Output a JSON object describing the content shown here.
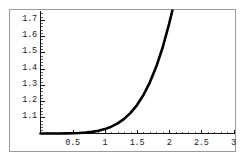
{
  "figure": {
    "name": "exponential-growth-plot",
    "frame_color": "#9a9a9a",
    "axis_color": "#141414",
    "curve_color": "#000000",
    "background": "#ffffff"
  },
  "chart_data": {
    "type": "line",
    "title": "",
    "subtitle": "",
    "xlabel": "",
    "ylabel": "",
    "xlim": [
      0,
      3
    ],
    "ylim": [
      1.0,
      1.75
    ],
    "grid": false,
    "legend": null,
    "annotations": [],
    "x_ticks": [
      {
        "value": 0.5,
        "label": "0.5"
      },
      {
        "value": 1,
        "label": "1"
      },
      {
        "value": 1.5,
        "label": "1.5"
      },
      {
        "value": 2,
        "label": "2"
      },
      {
        "value": 2.5,
        "label": "2.5"
      },
      {
        "value": 3,
        "label": "3"
      }
    ],
    "y_ticks": [
      {
        "value": 1.1,
        "label": "1.1"
      },
      {
        "value": 1.2,
        "label": "1.2"
      },
      {
        "value": 1.3,
        "label": "1.3"
      },
      {
        "value": 1.4,
        "label": "1.4"
      },
      {
        "value": 1.5,
        "label": "1.5"
      },
      {
        "value": 1.6,
        "label": "1.6"
      },
      {
        "value": 1.7,
        "label": "1.7"
      }
    ],
    "series": [
      {
        "name": "curve",
        "x": [
          0.0,
          0.1,
          0.2,
          0.3,
          0.4,
          0.5,
          0.6,
          0.7,
          0.8,
          0.9,
          1.0,
          1.1,
          1.2,
          1.3,
          1.4,
          1.5,
          1.6,
          1.7,
          1.8,
          1.9,
          2.0,
          2.05
        ],
        "y": [
          1.0,
          1.0,
          1.0,
          1.0,
          1.001,
          1.002,
          1.003,
          1.006,
          1.01,
          1.017,
          1.027,
          1.042,
          1.062,
          1.09,
          1.127,
          1.175,
          1.237,
          1.315,
          1.412,
          1.531,
          1.676,
          1.757
        ]
      }
    ]
  }
}
